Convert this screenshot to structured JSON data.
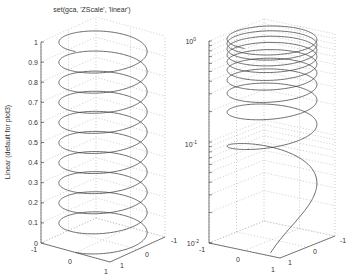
{
  "chart_data": [
    {
      "type": "line",
      "subtype": "plot3-helix",
      "title": "set(gca, 'ZScale', 'linear')",
      "xlabel": "",
      "ylabel": "",
      "zlabel": "Linear (default for plot3)",
      "zscale": "linear",
      "xlim": [
        -1,
        1
      ],
      "ylim": [
        -1,
        1
      ],
      "zlim": [
        0,
        1
      ],
      "x_ticks": [
        "-1",
        "0",
        "1"
      ],
      "y_ticks": [
        "1",
        "0",
        "-1"
      ],
      "z_ticks": [
        "0",
        "0.1",
        "0.2",
        "0.3",
        "0.4",
        "0.5",
        "0.6",
        "0.7",
        "0.8",
        "0.9",
        "1"
      ],
      "grid": true,
      "series": [
        {
          "name": "helix",
          "x": "sin(t)",
          "y": "cos(t)",
          "z": "t/(10*2*pi)",
          "turns": 10,
          "z_start": 0,
          "z_end": 1
        }
      ]
    },
    {
      "type": "line",
      "subtype": "plot3-helix",
      "title": "",
      "xlabel": "",
      "ylabel": "",
      "zlabel": "",
      "zscale": "log",
      "xlim": [
        -1,
        1
      ],
      "ylim": [
        -1,
        1
      ],
      "zlim": [
        0.01,
        1
      ],
      "x_ticks": [
        "-1",
        "0",
        "1"
      ],
      "y_ticks": [
        "1",
        "0",
        "-1"
      ],
      "z_ticks": [
        "10^-2",
        "10^-1",
        "10^0"
      ],
      "grid": true,
      "series": [
        {
          "name": "helix",
          "x": "sin(t)",
          "y": "cos(t)",
          "z": "t/(10*2*pi)",
          "turns": 10,
          "z_start": 0,
          "z_end": 1
        }
      ]
    }
  ],
  "left": {
    "title": "set(gca, 'ZScale', 'linear')",
    "zlabel": "Linear (default for plot3)",
    "z_ticks": [
      "0",
      "0.1",
      "0.2",
      "0.3",
      "0.4",
      "0.5",
      "0.6",
      "0.7",
      "0.8",
      "0.9",
      "1"
    ],
    "x_ticks": [
      "-1",
      "0",
      "1"
    ],
    "y_ticks": [
      "1",
      "0",
      "-1"
    ]
  },
  "right": {
    "z_tick_base": [
      "10",
      "10",
      "10"
    ],
    "z_tick_exp": [
      "-2",
      "-1",
      "0"
    ],
    "x_ticks": [
      "-1",
      "0",
      "1"
    ],
    "y_ticks": [
      "1",
      "0",
      "-1"
    ]
  },
  "colors": {
    "line": "#444444",
    "axis": "#555555",
    "grid": "#aaaaaa",
    "text": "#333333"
  }
}
